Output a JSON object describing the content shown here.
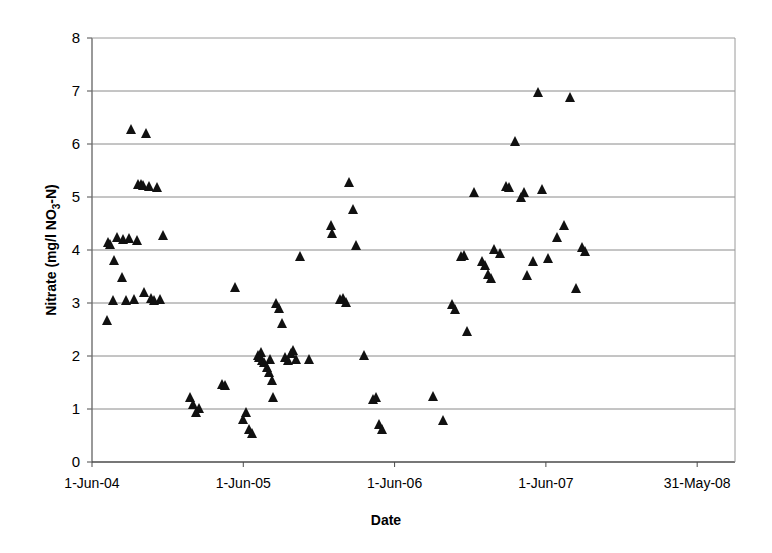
{
  "chart_data": {
    "type": "scatter",
    "title": "",
    "xlabel": "Date",
    "ylabel": "Nitrate (mg/l NO3-N)",
    "ylabel_parts": {
      "pre": "Nitrate (mg/l NO",
      "sub": "3",
      "post": "-N)"
    },
    "ylim": [
      0,
      8
    ],
    "yticks": [
      0,
      1,
      2,
      3,
      4,
      5,
      6,
      7,
      8
    ],
    "ytick_labels": [
      "0",
      "1",
      "2",
      "3",
      "4",
      "5",
      "6",
      "7",
      "8"
    ],
    "xticks": [
      0,
      1,
      2,
      3,
      4
    ],
    "xtick_labels": [
      "1-Jun-04",
      "1-Jun-05",
      "1-Jun-06",
      "1-Jun-07",
      "31-May-08"
    ],
    "xlim": [
      0,
      4.25
    ],
    "grid": "horizontal",
    "legend": "none",
    "marker": "filled-triangle",
    "marker_color": "#111111",
    "series": [
      {
        "name": "Nitrate",
        "points": [
          [
            0.1,
            2.68
          ],
          [
            0.11,
            4.15
          ],
          [
            0.12,
            4.12
          ],
          [
            0.14,
            3.05
          ],
          [
            0.15,
            3.82
          ],
          [
            0.17,
            4.25
          ],
          [
            0.2,
            3.5
          ],
          [
            0.21,
            4.2
          ],
          [
            0.23,
            3.05
          ],
          [
            0.25,
            4.22
          ],
          [
            0.26,
            6.28
          ],
          [
            0.28,
            3.08
          ],
          [
            0.3,
            4.18
          ],
          [
            0.31,
            5.25
          ],
          [
            0.33,
            5.25
          ],
          [
            0.34,
            5.22
          ],
          [
            0.35,
            3.2
          ],
          [
            0.36,
            6.2
          ],
          [
            0.38,
            5.2
          ],
          [
            0.39,
            3.1
          ],
          [
            0.41,
            3.05
          ],
          [
            0.43,
            5.18
          ],
          [
            0.45,
            3.08
          ],
          [
            0.47,
            4.28
          ],
          [
            0.65,
            1.22
          ],
          [
            0.67,
            1.1
          ],
          [
            0.69,
            0.95
          ],
          [
            0.71,
            1.02
          ],
          [
            0.86,
            1.48
          ],
          [
            0.88,
            1.45
          ],
          [
            0.95,
            3.3
          ],
          [
            1.0,
            0.82
          ],
          [
            1.02,
            0.95
          ],
          [
            1.04,
            0.62
          ],
          [
            1.06,
            0.55
          ],
          [
            1.1,
            2.02
          ],
          [
            1.11,
            1.98
          ],
          [
            1.12,
            2.08
          ],
          [
            1.13,
            1.92
          ],
          [
            1.14,
            1.88
          ],
          [
            1.16,
            1.8
          ],
          [
            1.17,
            1.7
          ],
          [
            1.18,
            1.95
          ],
          [
            1.19,
            1.55
          ],
          [
            1.2,
            1.22
          ],
          [
            1.22,
            3.0
          ],
          [
            1.24,
            2.9
          ],
          [
            1.26,
            2.62
          ],
          [
            1.28,
            1.98
          ],
          [
            1.3,
            1.92
          ],
          [
            1.32,
            2.05
          ],
          [
            1.33,
            2.12
          ],
          [
            1.35,
            1.95
          ],
          [
            1.38,
            3.88
          ],
          [
            1.44,
            1.95
          ],
          [
            1.58,
            4.48
          ],
          [
            1.59,
            4.32
          ],
          [
            1.64,
            3.08
          ],
          [
            1.66,
            3.1
          ],
          [
            1.68,
            3.02
          ],
          [
            1.7,
            5.28
          ],
          [
            1.73,
            4.78
          ],
          [
            1.75,
            4.1
          ],
          [
            1.8,
            2.02
          ],
          [
            1.86,
            1.18
          ],
          [
            1.88,
            1.22
          ],
          [
            1.9,
            0.72
          ],
          [
            1.92,
            0.62
          ],
          [
            2.26,
            1.25
          ],
          [
            2.32,
            0.8
          ],
          [
            2.38,
            2.98
          ],
          [
            2.4,
            2.88
          ],
          [
            2.44,
            3.88
          ],
          [
            2.46,
            3.9
          ],
          [
            2.48,
            2.48
          ],
          [
            2.53,
            5.1
          ],
          [
            2.58,
            3.8
          ],
          [
            2.6,
            3.72
          ],
          [
            2.62,
            3.55
          ],
          [
            2.64,
            3.48
          ],
          [
            2.66,
            4.02
          ],
          [
            2.7,
            3.95
          ],
          [
            2.74,
            5.2
          ],
          [
            2.76,
            5.18
          ],
          [
            2.8,
            6.05
          ],
          [
            2.84,
            5.0
          ],
          [
            2.86,
            5.1
          ],
          [
            2.88,
            3.52
          ],
          [
            2.92,
            3.8
          ],
          [
            2.95,
            6.98
          ],
          [
            2.98,
            5.15
          ],
          [
            3.02,
            3.85
          ],
          [
            3.08,
            4.25
          ],
          [
            3.12,
            4.48
          ],
          [
            3.16,
            6.88
          ],
          [
            3.2,
            3.28
          ],
          [
            3.24,
            4.05
          ],
          [
            3.26,
            3.98
          ]
        ]
      }
    ]
  },
  "axes": {
    "plot_left_px": 92,
    "plot_right_px": 735,
    "plot_top_px": 38,
    "plot_bottom_px": 462
  }
}
